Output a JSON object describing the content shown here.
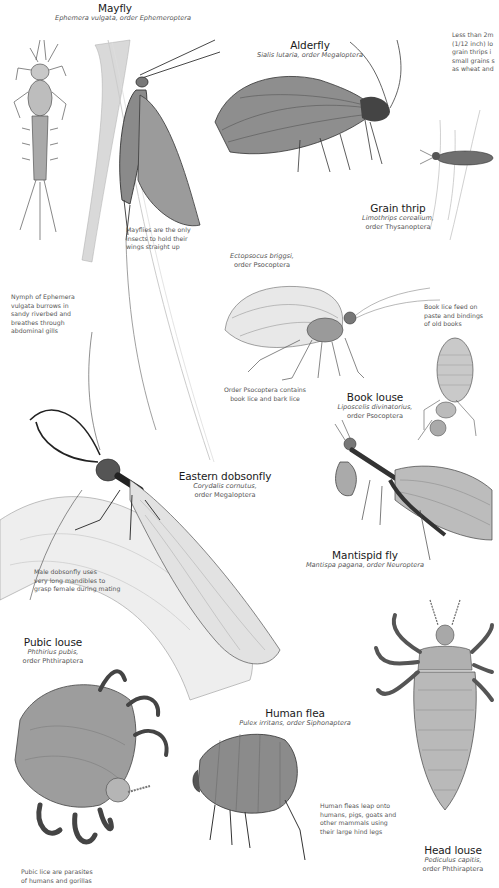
{
  "page": {
    "type": "illustrated insect reference plate",
    "background": "#ffffff"
  },
  "species": [
    {
      "id": "mayfly",
      "common_name": "Mayfly",
      "scientific_name": "Ephemera vulgata",
      "order": "order Ephemeroptera",
      "subtitle": "Ephemera vulgata, order Ephemeroptera"
    },
    {
      "id": "alderfly",
      "common_name": "Alderfly",
      "scientific_name": "Sialis lutaria",
      "order": "order Megaloptera",
      "subtitle": "Sialis lutaria, order Megaloptera"
    },
    {
      "id": "grain-thrip",
      "common_name": "Grain thrip",
      "scientific_name": "Limothrips cerealium,",
      "order": "order Thysanoptera"
    },
    {
      "id": "ectopsocus",
      "common_name": "",
      "scientific_name": "Ectopsocus briggsi,",
      "order": "order Psocoptera"
    },
    {
      "id": "book-louse",
      "common_name": "Book louse",
      "scientific_name": "Liposcelis divinatorius,",
      "order": "order Psocoptera"
    },
    {
      "id": "eastern-dobsonfly",
      "common_name": "Eastern dobsonfly",
      "scientific_name": "Corydalis cornutus,",
      "order": "order Megaloptera"
    },
    {
      "id": "mantispid-fly",
      "common_name": "Mantispid fly",
      "scientific_name": "Mantispa pagana",
      "order": "order Neuroptera",
      "subtitle": "Mantispa pagana, order Neuroptera"
    },
    {
      "id": "pubic-louse",
      "common_name": "Pubic louse",
      "scientific_name": "Phthirius pubis,",
      "order": "order Phthiraptera"
    },
    {
      "id": "human-flea",
      "common_name": "Human flea",
      "scientific_name": "Pulex irritans",
      "order": "order Siphonaptera",
      "subtitle": "Pulex irritans, order Siphonaptera"
    },
    {
      "id": "head-louse",
      "common_name": "Head louse",
      "scientific_name": "Pediculus capitis,",
      "order": "order Phthiraptera"
    }
  ],
  "notes": {
    "grain_thrip": [
      "Less than 2m",
      "(1/12 inch) lo",
      "grain thrips i",
      "small grains s",
      "as wheat and"
    ],
    "mayfly_wings": [
      "Mayflies are the only",
      "insects to hold their",
      "wings straight up"
    ],
    "nymph": [
      "Nymph of Ephemera",
      "vulgata burrows in",
      "sandy riverbed and",
      "breathes through",
      "abdominal gills"
    ],
    "book_lice_feed": [
      "Book lice feed on",
      "paste and bindings",
      "of old books"
    ],
    "psocoptera": [
      "Order Psocoptera contains",
      "book lice and bark lice"
    ],
    "dobsonfly": [
      "Male dobsonfly uses",
      "very long mandibles to",
      "grasp female during mating"
    ],
    "human_flea": [
      "Human fleas leap onto",
      "humans, pigs, goats and",
      "other mammals using",
      "their large hind legs"
    ],
    "pubic_lice": [
      "Pubic lice are parasites",
      "of humans and gorillas"
    ]
  }
}
